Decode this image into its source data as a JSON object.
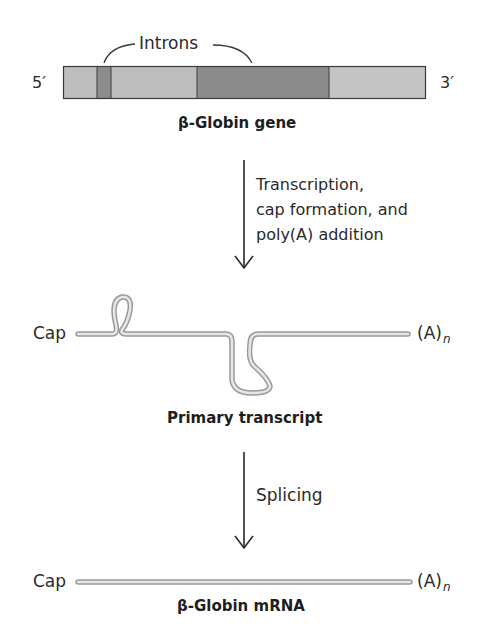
{
  "gene": {
    "five_prime": "5′",
    "three_prime": "3′",
    "introns_label": "Introns",
    "title": "β-Globin gene",
    "segments": [
      {
        "type": "exon",
        "x0": 63,
        "x1": 97,
        "color": "#bdbdbd"
      },
      {
        "type": "intron",
        "x0": 97,
        "x1": 111,
        "color": "#8c8c8c"
      },
      {
        "type": "exon",
        "x0": 111,
        "x1": 197,
        "color": "#bdbdbd"
      },
      {
        "type": "intron",
        "x0": 197,
        "x1": 329,
        "color": "#8c8c8c"
      },
      {
        "type": "exon",
        "x0": 329,
        "x1": 426,
        "color": "#c4c4c4"
      }
    ]
  },
  "step1": {
    "lines": [
      "Transcription,",
      "cap formation, and",
      "poly(A) addition"
    ]
  },
  "primary_transcript": {
    "cap": "Cap",
    "tail": "(A)",
    "tail_sub": "n",
    "title": "Primary transcript"
  },
  "step2": {
    "label": "Splicing"
  },
  "mrna": {
    "cap": "Cap",
    "tail": "(A)",
    "tail_sub": "n",
    "title": "β-Globin mRNA"
  },
  "colors": {
    "exon": "#bdbdbd",
    "intron": "#8c8c8c",
    "outline": "#3a3a3a",
    "rna_outer": "#9a9a9a",
    "rna_inner": "#e0e0e0"
  }
}
